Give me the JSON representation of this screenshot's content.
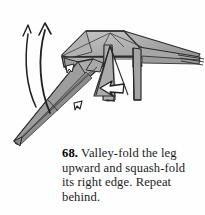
{
  "page": {
    "background_color": "#fefefe",
    "width": 205,
    "height": 215
  },
  "caption": {
    "step_number": "68.",
    "text": "Valley-fold the leg upward and squash-fold its right edge. Repeat behind.",
    "full_text": "68. Valley-fold the leg upward and squash-fold its right edge. Repeat behind.",
    "text_color": "#1b1b1b"
  },
  "diagram": {
    "colors": {
      "paper_light": "#c9c9c9",
      "paper_mid": "#a8a8a8",
      "paper_dark": "#8a8a8a",
      "paper_shadow": "#6f6f6f",
      "outline": "#2b2b2b",
      "crease": "#4a4a4a",
      "arrow": "#1f1f1f",
      "background": "#fefefe"
    },
    "annotations": [
      {
        "name": "valley-fold-arrow-outer",
        "type": "curved-arrow",
        "label": "valley-fold leg upward",
        "direction": "up",
        "head_style": "open-half"
      },
      {
        "name": "valley-fold-arrow-inner",
        "type": "curved-arrow",
        "label": "valley-fold leg upward",
        "direction": "up",
        "head_style": "open"
      },
      {
        "name": "squash-fold-arrow",
        "type": "hollow-push-arrow",
        "label": "squash-fold right edge",
        "direction": "left"
      },
      {
        "name": "leg-crease-arrow",
        "type": "small-hollow-arrow",
        "label": "fold indicator on leg",
        "direction": "down-left"
      }
    ]
  }
}
